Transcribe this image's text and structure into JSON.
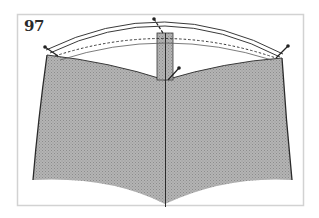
{
  "figure": {
    "number": "97"
  },
  "colors": {
    "frame": "#d4d4d4",
    "fabric_fill": "#a8a8a8",
    "outline": "#2b2b2b",
    "background": "#ffffff"
  }
}
